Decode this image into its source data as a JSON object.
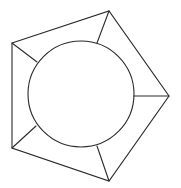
{
  "diagram": {
    "type": "geometric-figure",
    "stroke_color": "#2a2a2a",
    "background": "#ffffff",
    "pentagon": {
      "vertices": [
        {
          "name": "top-left",
          "x": 12,
          "y": 43
        },
        {
          "name": "top",
          "x": 109,
          "y": 11
        },
        {
          "name": "right",
          "x": 169,
          "y": 96
        },
        {
          "name": "bottom",
          "x": 109,
          "y": 181
        },
        {
          "name": "bottom-left",
          "x": 12,
          "y": 148
        }
      ]
    },
    "circle": {
      "cx": 81,
      "cy": 94,
      "r": 53
    },
    "spokes": [
      {
        "from": "top-left",
        "x1": 12,
        "y1": 43,
        "x2": 37,
        "y2": 62
      },
      {
        "from": "top",
        "x1": 109,
        "y1": 11,
        "x2": 97,
        "y2": 43
      },
      {
        "from": "right",
        "x1": 169,
        "y1": 96,
        "x2": 134,
        "y2": 96
      },
      {
        "from": "bottom",
        "x1": 109,
        "y1": 181,
        "x2": 97,
        "y2": 146
      },
      {
        "from": "bottom-left",
        "x1": 12,
        "y1": 148,
        "x2": 36,
        "y2": 126
      }
    ]
  }
}
